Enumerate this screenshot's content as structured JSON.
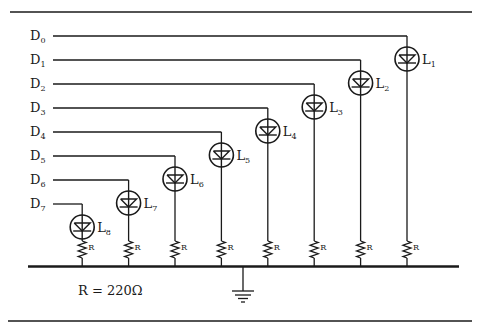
{
  "diagram": {
    "type": "circuit-schematic",
    "inputs": [
      {
        "label": "D",
        "sub": "0"
      },
      {
        "label": "D",
        "sub": "1"
      },
      {
        "label": "D",
        "sub": "2"
      },
      {
        "label": "D",
        "sub": "3"
      },
      {
        "label": "D",
        "sub": "4"
      },
      {
        "label": "D",
        "sub": "5"
      },
      {
        "label": "D",
        "sub": "6"
      },
      {
        "label": "D",
        "sub": "7"
      }
    ],
    "leds": [
      {
        "label": "L",
        "sub": "1",
        "input": 0
      },
      {
        "label": "L",
        "sub": "2",
        "input": 1
      },
      {
        "label": "L",
        "sub": "3",
        "input": 2
      },
      {
        "label": "L",
        "sub": "4",
        "input": 3
      },
      {
        "label": "L",
        "sub": "5",
        "input": 4
      },
      {
        "label": "L",
        "sub": "6",
        "input": 5
      },
      {
        "label": "L",
        "sub": "7",
        "input": 6
      },
      {
        "label": "L",
        "sub": "8",
        "input": 7
      }
    ],
    "resistor_label": "R",
    "resistor_value_note": "R = 220Ω",
    "ground": "ground-symbol"
  }
}
